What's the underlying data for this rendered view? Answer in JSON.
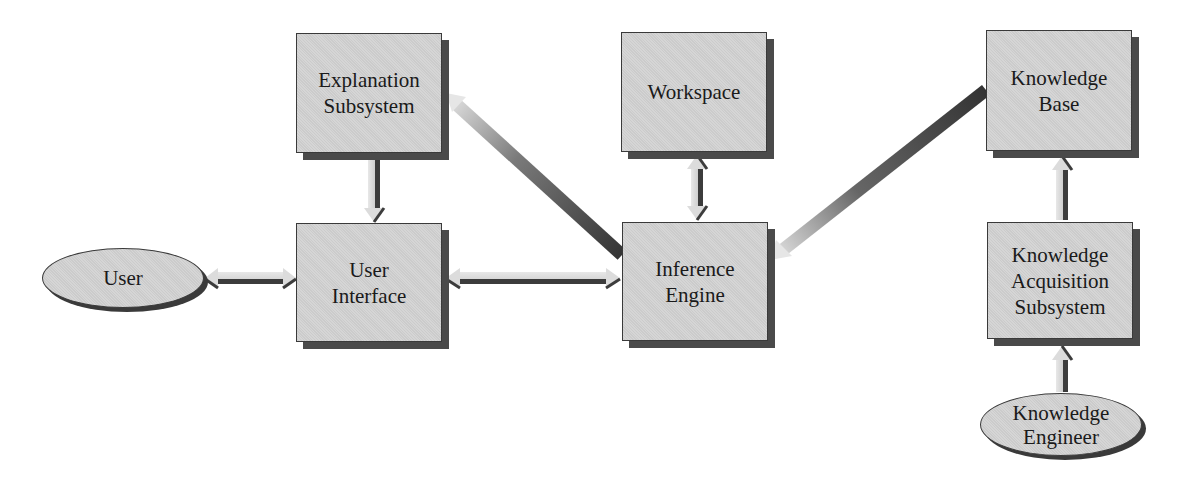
{
  "diagram": {
    "nodes": {
      "explanation": {
        "label": "Explanation\nSubsystem",
        "shape": "box"
      },
      "workspace": {
        "label": "Workspace",
        "shape": "box"
      },
      "knowledge_base": {
        "label": "Knowledge\nBase",
        "shape": "box"
      },
      "user": {
        "label": "User",
        "shape": "ellipse"
      },
      "user_interface": {
        "label": "User\nInterface",
        "shape": "box"
      },
      "inference_engine": {
        "label": "Inference\nEngine",
        "shape": "box"
      },
      "knowledge_acquisition": {
        "label": "Knowledge\nAcquisition\nSubsystem",
        "shape": "box"
      },
      "knowledge_engineer": {
        "label": "Knowledge\nEngineer",
        "shape": "ellipse"
      }
    },
    "edges": [
      {
        "from": "user",
        "to": "user_interface",
        "direction": "both"
      },
      {
        "from": "user_interface",
        "to": "inference_engine",
        "direction": "both"
      },
      {
        "from": "explanation",
        "to": "user_interface",
        "direction": "forward"
      },
      {
        "from": "inference_engine",
        "to": "explanation",
        "direction": "forward"
      },
      {
        "from": "workspace",
        "to": "inference_engine",
        "direction": "both"
      },
      {
        "from": "knowledge_base",
        "to": "inference_engine",
        "direction": "forward"
      },
      {
        "from": "knowledge_acquisition",
        "to": "knowledge_base",
        "direction": "forward"
      },
      {
        "from": "knowledge_engineer",
        "to": "knowledge_acquisition",
        "direction": "forward"
      }
    ],
    "colors": {
      "box_fill": "#d2d2d2",
      "shadow": "#4a4a4a",
      "arrow_light": "#e4e4e4",
      "arrow_dark": "#3c3c3c"
    }
  }
}
